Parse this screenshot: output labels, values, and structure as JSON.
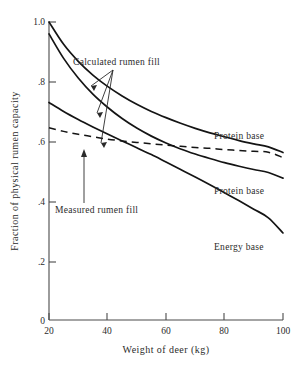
{
  "chart_data": {
    "type": "line",
    "title": "",
    "xlabel": "Weight of deer (kg)",
    "ylabel": "Fraction of physical rumen capacity",
    "xlim": [
      20,
      100
    ],
    "ylim": [
      0,
      1.0
    ],
    "xticks": [
      "20",
      "40",
      "60",
      "80",
      "100"
    ],
    "xtick_values": [
      20,
      40,
      60,
      80,
      100
    ],
    "yticks": [
      "0",
      ".2",
      ".4",
      ".6",
      ".8",
      "1.0"
    ],
    "ytick_values": [
      0,
      0.2,
      0.4,
      0.6,
      0.8,
      1.0
    ],
    "grid": false,
    "legend_position": "inline-right-of-curves",
    "x": [
      20,
      25,
      30,
      35,
      40,
      45,
      50,
      55,
      60,
      65,
      70,
      75,
      80,
      85,
      90,
      95,
      100
    ],
    "series": [
      {
        "name": "Protein base (upper)",
        "label": "Protein base",
        "style": "solid",
        "values": [
          1.0,
          0.925,
          0.868,
          0.822,
          0.784,
          0.752,
          0.724,
          0.7,
          0.679,
          0.66,
          0.643,
          0.628,
          0.615,
          0.602,
          0.591,
          0.581,
          0.562
        ]
      },
      {
        "name": "Protein base (lower)",
        "label": "Protein base",
        "style": "solid",
        "values": [
          0.96,
          0.878,
          0.812,
          0.758,
          0.714,
          0.676,
          0.644,
          0.617,
          0.594,
          0.574,
          0.557,
          0.542,
          0.528,
          0.516,
          0.505,
          0.495,
          0.476
        ]
      },
      {
        "name": "Energy base",
        "label": "Energy base",
        "style": "solid",
        "values": [
          0.73,
          0.7,
          0.673,
          0.648,
          0.624,
          0.601,
          0.578,
          0.555,
          0.53,
          0.505,
          0.48,
          0.454,
          0.427,
          0.4,
          0.372,
          0.343,
          0.292
        ]
      },
      {
        "name": "Measured rumen fill",
        "label": "Measured rumen fill",
        "style": "dashed",
        "values": [
          0.645,
          0.633,
          0.623,
          0.615,
          0.607,
          0.601,
          0.596,
          0.591,
          0.587,
          0.583,
          0.579,
          0.576,
          0.572,
          0.569,
          0.566,
          0.563,
          0.545
        ]
      }
    ],
    "annotations": [
      {
        "text": "Calculated rumen fill",
        "points_to": [
          "Protein base (upper)",
          "Protein base (lower)",
          "Energy base"
        ]
      },
      {
        "text": "Measured rumen fill",
        "points_to": [
          "Measured rumen fill"
        ]
      }
    ],
    "curve_labels": [
      {
        "text": "Protein base"
      },
      {
        "text": "Protein base"
      },
      {
        "text": "Energy base"
      }
    ]
  }
}
